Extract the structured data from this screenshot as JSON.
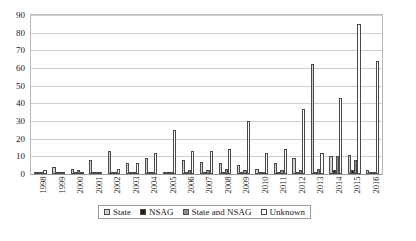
{
  "chart_data": {
    "type": "bar",
    "title": "",
    "subtitle": "",
    "xlabel": "",
    "ylabel": "",
    "ylim": [
      0,
      90
    ],
    "yticks": [
      0,
      10,
      20,
      30,
      40,
      50,
      60,
      70,
      80,
      90
    ],
    "grid": true,
    "legend_position": "bottom",
    "categories": [
      "1998",
      "1999",
      "2000",
      "2001",
      "2002",
      "2003",
      "2004",
      "2005",
      "2006",
      "2007",
      "2008",
      "2009",
      "2010",
      "2011",
      "2012",
      "2013",
      "2014",
      "2015",
      "2016"
    ],
    "series": [
      {
        "name": "State",
        "swatch": "#d2d2d2",
        "values": [
          1,
          4,
          3,
          8,
          13,
          6,
          9,
          0,
          8,
          7,
          6,
          5,
          3,
          6,
          9,
          62,
          10,
          11,
          2
        ]
      },
      {
        "name": "NSAG",
        "swatch": "#1c1c1c",
        "values": [
          0,
          0,
          0,
          1,
          0,
          0,
          1,
          0,
          0,
          0,
          1,
          1,
          0,
          0,
          1,
          1,
          2,
          2,
          0
        ]
      },
      {
        "name": "State and NSAG",
        "swatch": "#8f8f8f",
        "values": [
          1,
          1,
          2,
          0,
          1,
          0,
          0,
          0,
          2,
          2,
          3,
          2,
          1,
          2,
          2,
          3,
          10,
          8,
          0
        ]
      },
      {
        "name": "Unknown",
        "swatch": "#ffffff",
        "values": [
          2,
          1,
          0,
          0,
          3,
          6,
          12,
          25,
          13,
          13,
          14,
          30,
          12,
          14,
          37,
          12,
          43,
          85,
          64
        ]
      }
    ]
  },
  "legend": {
    "items": [
      {
        "label": "State"
      },
      {
        "label": "NSAG"
      },
      {
        "label": "State and NSAG"
      },
      {
        "label": "Unknown"
      }
    ]
  }
}
